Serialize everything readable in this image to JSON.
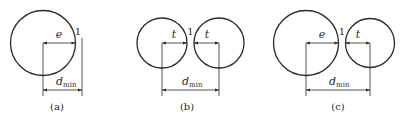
{
  "panels": [
    {
      "id": "a",
      "caption": "(a)",
      "left_label": "e",
      "gap_label": "1",
      "dim_label_main": "d",
      "dim_label_sub": "min"
    },
    {
      "id": "b",
      "caption": "(b)",
      "left_label": "t",
      "right_label": "t",
      "gap_label": "1",
      "dim_label_main": "d",
      "dim_label_sub": "min"
    },
    {
      "id": "c",
      "caption": "(c)",
      "left_label": "e",
      "right_label": "t",
      "gap_label": "1",
      "dim_label_main": "d",
      "dim_label_sub": "min"
    }
  ],
  "colors": {
    "line": "#2a2a2a",
    "background": "#ffffff"
  }
}
